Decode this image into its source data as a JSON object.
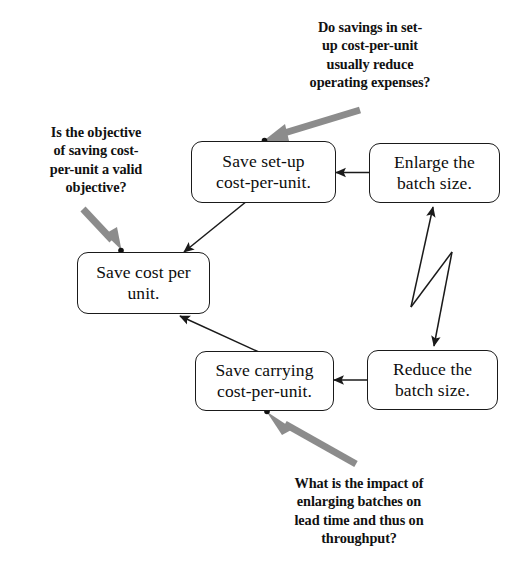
{
  "diagram": {
    "colors": {
      "box_border": "#1a1a1a",
      "box_fill": "#ffffff",
      "arrow_black": "#1a1a1a",
      "arrow_gray": "#8c8c8c",
      "text": "#111111"
    },
    "nodes": [
      {
        "id": "save-setup-cost-per-unit",
        "lines": [
          "Save set-up",
          "cost-per-unit."
        ]
      },
      {
        "id": "enlarge-the-batch-size",
        "lines": [
          "Enlarge the",
          "batch size."
        ]
      },
      {
        "id": "save-cost-per-unit",
        "lines": [
          "Save cost per",
          "unit."
        ]
      },
      {
        "id": "save-carrying-cost-per-unit",
        "lines": [
          "Save carrying",
          "cost-per-unit."
        ]
      },
      {
        "id": "reduce-the-batch-size",
        "lines": [
          "Reduce the",
          "batch size."
        ]
      }
    ],
    "notes": [
      {
        "id": "note-setup-savings",
        "lines": [
          "Do savings in set-",
          "up cost-per-unit",
          "usually reduce",
          "operating expenses?"
        ]
      },
      {
        "id": "note-valid-objective",
        "lines": [
          "Is the objective",
          "of saving cost-",
          "per-unit a valid",
          "objective?"
        ]
      },
      {
        "id": "note-batch-impact",
        "lines": [
          "What is the impact of",
          "enlarging batches on",
          "lead time and thus on",
          "throughput?"
        ]
      }
    ],
    "connectors": [
      {
        "id": "enlarge-to-save-setup",
        "style": "arrow",
        "from": "enlarge-the-batch-size",
        "to": "save-setup-cost-per-unit"
      },
      {
        "id": "save-setup-to-save-cost",
        "style": "arrow",
        "from": "save-setup-cost-per-unit",
        "to": "save-cost-per-unit"
      },
      {
        "id": "save-carrying-to-save-cost",
        "style": "arrow",
        "from": "save-carrying-cost-per-unit",
        "to": "save-cost-per-unit"
      },
      {
        "id": "reduce-to-save-carrying",
        "style": "arrow",
        "from": "reduce-the-batch-size",
        "to": "save-carrying-cost-per-unit"
      },
      {
        "id": "enlarge-reduce-conflict",
        "style": "zigzag-conflict",
        "from": "reduce-the-batch-size",
        "to": "enlarge-the-batch-size"
      }
    ],
    "callout_arrows": [
      {
        "id": "callout-setup-savings",
        "points_to": "save-setup-cost-per-unit",
        "color": "#8c8c8c"
      },
      {
        "id": "callout-valid-objective",
        "points_to": "save-cost-per-unit",
        "color": "#8c8c8c"
      },
      {
        "id": "callout-batch-impact",
        "points_to": "save-carrying-cost-per-unit",
        "color": "#8c8c8c"
      }
    ]
  }
}
